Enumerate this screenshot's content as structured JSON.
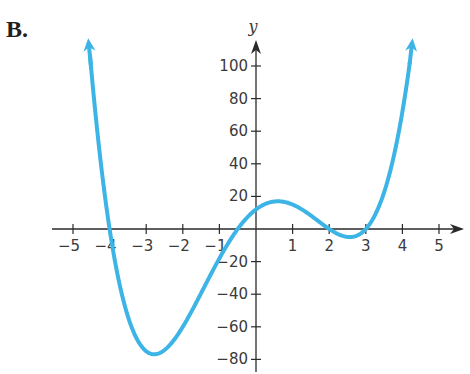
{
  "figure_label": "B.",
  "chart_data": {
    "type": "line",
    "title": "",
    "xlabel": "",
    "ylabel": "y",
    "function": "y = (x + 4)(x + 0.5)(x - 2)(x - 3)",
    "x_ticks": [
      -5,
      -4,
      -3,
      -2,
      -1,
      1,
      2,
      3,
      4,
      5
    ],
    "x_tick_labels": [
      "−5",
      "−4",
      "−3",
      "−2",
      "−1",
      "1",
      "2",
      "3",
      "4",
      "5"
    ],
    "y_ticks": [
      100,
      80,
      60,
      40,
      20,
      -20,
      -40,
      -60,
      -80
    ],
    "y_tick_labels": [
      "100",
      "80",
      "60",
      "40",
      "20",
      "−20",
      "−40",
      "−60",
      "−80"
    ],
    "xlim": [
      -5.5,
      5.5
    ],
    "ylim": [
      -85,
      110
    ],
    "grid": false,
    "legend": null,
    "x_intercepts": [
      -4,
      -0.5,
      2,
      3
    ],
    "y_intercept": 12,
    "local_max": {
      "x": 0.6,
      "y": 16
    },
    "local_min": [
      {
        "x": -2.7,
        "y": -77
      },
      {
        "x": 2.6,
        "y": -3
      }
    ],
    "series": [
      {
        "name": "f(x)",
        "color": "#3cb4e6",
        "x": [
          -4.55,
          -4.5,
          -4.25,
          -4,
          -3.75,
          -3.5,
          -3.25,
          -3,
          -2.75,
          -2.5,
          -2.25,
          -2,
          -1.75,
          -1.5,
          -1.25,
          -1,
          -0.75,
          -0.5,
          -0.25,
          0,
          0.25,
          0.5,
          0.75,
          1,
          1.25,
          1.5,
          1.75,
          2,
          2.25,
          2.5,
          2.75,
          3,
          3.25,
          3.5,
          3.75,
          4,
          4.2
        ],
        "values": [
          107.3,
          97.5,
          45.2,
          0,
          -36.6,
          -60.5,
          -73.9,
          -78.0,
          -74.8,
          -66.3,
          -54.1,
          -40.0,
          -25.8,
          -12.8,
          -2.1,
          6.0,
          3.2,
          0,
          3.5,
          12.0,
          15.2,
          16.5,
          15.9,
          13.5,
          10.0,
          6.0,
          2.5,
          0,
          -1.7,
          -2.3,
          -1.8,
          0,
          3.6,
          9.4,
          18.1,
          30.0,
          41.5
        ]
      }
    ],
    "arrow_ends": [
      {
        "x": -4.6,
        "y": 110
      },
      {
        "x": 4.25,
        "y": 110
      }
    ]
  },
  "axes": {
    "x_arrow": true,
    "y_arrow": true,
    "axis_color": "#2a2a2a",
    "curve_color": "#3cb4e6"
  }
}
